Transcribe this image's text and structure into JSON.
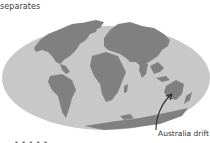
{
  "diagram": {
    "type": "world-map-continental-drift",
    "projection": "oval (Mollweide-style)",
    "caption_top": "separates",
    "annotations": [
      {
        "label": "Australia drift",
        "target": "Australia",
        "arrow": true
      }
    ],
    "bottom_cut_text": "• • • • •",
    "colors": {
      "background": "#ffffff",
      "ocean": "#c8c8c8",
      "land": "#808080",
      "land_shadow": "#6e6e6e",
      "text": "#333333",
      "arrow": "#2a2a2a"
    }
  }
}
